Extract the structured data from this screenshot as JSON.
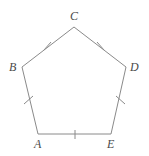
{
  "figure": {
    "name": "regular-pentagon-ABCDE",
    "kind": "geometry-diagram",
    "background_color": "#ffffff",
    "stroke_color": "#8a8a8a",
    "stroke_width": 1,
    "label_color": "#4a4a4a",
    "tick_color": "#8a8a8a",
    "canvas": {
      "width": 149,
      "height": 156
    }
  },
  "vertices": [
    {
      "id": "A",
      "label": "A",
      "x": 38,
      "y": 134,
      "label_x": 34,
      "label_y": 138
    },
    {
      "id": "B",
      "label": "B",
      "x": 22,
      "y": 67,
      "label_x": 9,
      "label_y": 61
    },
    {
      "id": "C",
      "label": "C",
      "x": 74,
      "y": 27,
      "label_x": 70,
      "label_y": 10
    },
    {
      "id": "D",
      "label": "D",
      "x": 126,
      "y": 67,
      "label_x": 130,
      "label_y": 61
    },
    {
      "id": "E",
      "label": "E",
      "x": 111,
      "y": 134,
      "label_x": 107,
      "label_y": 138
    }
  ],
  "edges": [
    {
      "id": "AB",
      "from": "A",
      "to": "B",
      "ticks": 1
    },
    {
      "id": "BC",
      "from": "B",
      "to": "C",
      "ticks": 1
    },
    {
      "id": "CD",
      "from": "C",
      "to": "D",
      "ticks": 1
    },
    {
      "id": "DE",
      "from": "D",
      "to": "E",
      "ticks": 1
    },
    {
      "id": "EA",
      "from": "E",
      "to": "A",
      "ticks": 1
    }
  ],
  "tick_marks": [
    {
      "edge": "AB",
      "x1": 24,
      "y1": 104,
      "x2": 33,
      "y2": 96
    },
    {
      "edge": "BC",
      "x1": 44,
      "y1": 50,
      "x2": 51,
      "y2": 42
    },
    {
      "edge": "CD",
      "x1": 97,
      "y1": 42,
      "x2": 104,
      "y2": 50
    },
    {
      "edge": "DE",
      "x1": 116,
      "y1": 96,
      "x2": 125,
      "y2": 104
    },
    {
      "edge": "EA",
      "x1": 75,
      "y1": 130,
      "x2": 75,
      "y2": 139
    }
  ],
  "tick_length": 11
}
